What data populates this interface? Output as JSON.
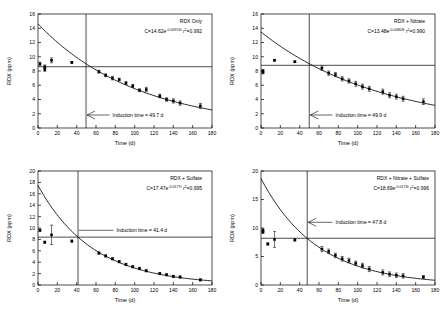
{
  "figure": {
    "panel_count": 4,
    "axis_titles": {
      "x": "Time (d)",
      "y": "RDX (ppm)"
    }
  },
  "chart_data": [
    {
      "type": "scatter",
      "id": "panel-rdx-only",
      "title": "RDX Only",
      "equation_prefix": "C=14.62e",
      "equation_exponent": "-0.00974t",
      "equation_r2_label": "r",
      "equation_r2_sup": "2",
      "equation_r2_value": "=0.992",
      "fit": {
        "A": 14.62,
        "k": 0.00974,
        "r2": 0.992
      },
      "induction_label": "Induction time = 49.7 d",
      "induction_time": 49.7,
      "plateau": 8.6,
      "xlabel": "Time (d)",
      "ylabel": "RDX (ppm)",
      "xlim": [
        0,
        180
      ],
      "ylim": [
        0,
        16
      ],
      "xticks": [
        0,
        20,
        40,
        60,
        80,
        100,
        120,
        140,
        160,
        180
      ],
      "yticks": [
        0,
        2,
        4,
        6,
        8,
        10,
        12,
        14,
        16
      ],
      "grid": false,
      "legend": "none",
      "x": [
        2,
        7,
        7,
        14,
        35,
        63,
        70,
        77,
        84,
        91,
        98,
        105,
        112,
        126,
        133,
        140,
        147,
        168
      ],
      "y": [
        9.0,
        8.6,
        8.2,
        9.5,
        9.2,
        7.9,
        7.4,
        7.0,
        6.8,
        6.3,
        5.9,
        5.3,
        5.4,
        4.5,
        4.0,
        3.8,
        3.5,
        3.1
      ],
      "yerr": [
        0.25,
        0.25,
        0.25,
        0.35,
        0.12,
        0.2,
        0.2,
        0.25,
        0.2,
        0.2,
        0.2,
        0.2,
        0.3,
        0.25,
        0.25,
        0.3,
        0.3,
        0.35
      ]
    },
    {
      "type": "scatter",
      "id": "panel-rdx-nitrate",
      "title": "RDX + Nitrate",
      "equation_prefix": "C=13.48e",
      "equation_exponent": "-0.00803t",
      "equation_r2_label": "r",
      "equation_r2_sup": "2",
      "equation_r2_value": "=0.990",
      "fit": {
        "A": 13.48,
        "k": 0.00803,
        "r2": 0.99
      },
      "induction_label": "Induction time = 49.9 d",
      "induction_time": 49.9,
      "plateau": 8.8,
      "xlabel": "Time (d)",
      "ylabel": "RDX (ppm)",
      "xlim": [
        0,
        180
      ],
      "ylim": [
        0,
        16
      ],
      "xticks": [
        0,
        20,
        40,
        60,
        80,
        100,
        120,
        140,
        160,
        180
      ],
      "yticks": [
        0,
        2,
        4,
        6,
        8,
        10,
        12,
        14,
        16
      ],
      "grid": false,
      "legend": "none",
      "x": [
        2,
        2,
        14,
        35,
        63,
        70,
        77,
        84,
        91,
        98,
        105,
        112,
        126,
        133,
        140,
        147,
        168
      ],
      "y": [
        8.0,
        7.8,
        9.5,
        9.3,
        8.4,
        7.7,
        7.5,
        6.9,
        6.6,
        6.2,
        5.8,
        5.5,
        5.1,
        4.6,
        4.4,
        4.1,
        3.7
      ],
      "yerr": [
        0.2,
        0.2,
        0.12,
        0.12,
        0.3,
        0.3,
        0.3,
        0.3,
        0.3,
        0.35,
        0.35,
        0.35,
        0.35,
        0.35,
        0.35,
        0.35,
        0.4
      ]
    },
    {
      "type": "scatter",
      "id": "panel-rdx-sulfate",
      "title": "RDX + Sulfate",
      "equation_prefix": "C=17.47e",
      "equation_exponent": "-0.0177t",
      "equation_r2_label": "r",
      "equation_r2_sup": "2",
      "equation_r2_value": "=0.995",
      "fit": {
        "A": 17.47,
        "k": 0.0177,
        "r2": 0.995
      },
      "induction_label": "Induction time = 41.4 d",
      "induction_time": 41.4,
      "plateau": 8.4,
      "xlabel": "Time (d)",
      "ylabel": "RDX (ppm)",
      "xlim": [
        0,
        180
      ],
      "ylim": [
        0,
        20
      ],
      "xticks": [
        0,
        20,
        40,
        60,
        80,
        100,
        120,
        140,
        160,
        180
      ],
      "yticks": [
        0,
        2,
        4,
        6,
        8,
        10,
        12,
        14,
        16,
        18,
        20
      ],
      "grid": false,
      "legend": "none",
      "x": [
        2,
        7,
        14,
        35,
        63,
        70,
        77,
        84,
        91,
        98,
        105,
        112,
        126,
        133,
        140,
        147,
        168
      ],
      "y": [
        9.6,
        7.5,
        8.8,
        7.7,
        5.6,
        5.1,
        4.6,
        4.1,
        3.6,
        3.2,
        2.9,
        2.5,
        2.0,
        1.8,
        1.5,
        1.4,
        0.9
      ],
      "yerr": [
        0.2,
        0.2,
        1.7,
        0.2,
        0.2,
        0.2,
        0.2,
        0.2,
        0.2,
        0.2,
        0.2,
        0.2,
        0.2,
        0.2,
        0.2,
        0.2,
        0.2
      ]
    },
    {
      "type": "scatter",
      "id": "panel-rdx-nitrate-sulfate",
      "title": "RDX + Nitrate + Sulfate",
      "equation_prefix": "C=18.69e",
      "equation_exponent": "-0.0173t",
      "equation_r2_label": "r",
      "equation_r2_sup": "2",
      "equation_r2_value": "=0.996",
      "fit": {
        "A": 18.69,
        "k": 0.0173,
        "r2": 0.996
      },
      "induction_label": "Induction time = 47.8 d",
      "induction_time": 47.8,
      "plateau": 8.2,
      "xlabel": "Time (d)",
      "ylabel": "RDX (ppm)",
      "xlim": [
        0,
        180
      ],
      "ylim": [
        0,
        20
      ],
      "xticks": [
        0,
        20,
        40,
        60,
        80,
        100,
        120,
        140,
        160,
        180
      ],
      "yticks": [
        0,
        5,
        10,
        15,
        20
      ],
      "grid": false,
      "legend": "none",
      "x": [
        2,
        2,
        7,
        14,
        35,
        63,
        70,
        77,
        84,
        91,
        98,
        105,
        112,
        126,
        133,
        140,
        147,
        168
      ],
      "y": [
        9.6,
        9.3,
        7.2,
        8.0,
        7.9,
        6.3,
        5.9,
        5.2,
        4.6,
        4.3,
        3.8,
        3.4,
        2.8,
        2.2,
        1.9,
        1.7,
        1.6,
        1.4
      ],
      "yerr": [
        0.25,
        0.25,
        0.2,
        1.4,
        0.2,
        0.45,
        0.4,
        0.4,
        0.4,
        0.4,
        0.4,
        0.4,
        0.45,
        0.45,
        0.4,
        0.4,
        0.4,
        0.25
      ]
    }
  ]
}
